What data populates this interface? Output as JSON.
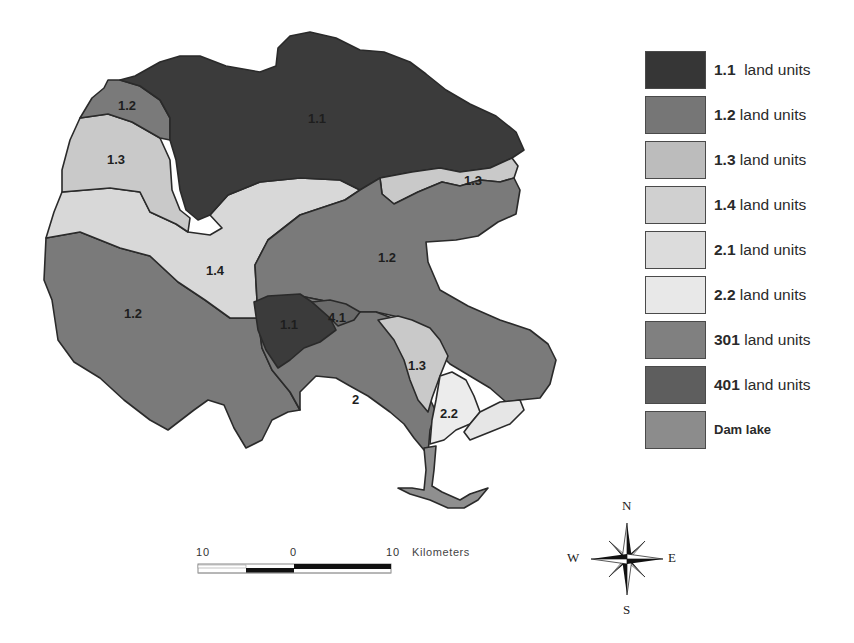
{
  "map": {
    "regions": [
      {
        "id": "1.1-north",
        "unit": "1.1",
        "label": "1.1",
        "color": "#3b3b3b"
      },
      {
        "id": "1.2-northwest",
        "unit": "1.2",
        "label": "1.2",
        "color": "#7a7a7a"
      },
      {
        "id": "1.3-northwest",
        "unit": "1.3",
        "label": "1.3",
        "color": "#c9c9c9"
      },
      {
        "id": "1.3-northeast",
        "unit": "1.3",
        "label": "1.3",
        "color": "#c9c9c9"
      },
      {
        "id": "1.4-central",
        "unit": "1.4",
        "label": "1.4",
        "color": "#d8d8d8"
      },
      {
        "id": "1.2-east",
        "unit": "1.2",
        "label": "1.2",
        "color": "#7a7a7a"
      },
      {
        "id": "1.2-southwest",
        "unit": "1.2",
        "label": "1.2",
        "color": "#7a7a7a"
      },
      {
        "id": "1.1-south",
        "unit": "1.1",
        "label": "1.1",
        "color": "#3b3b3b"
      },
      {
        "id": "4.1-south",
        "unit": "401",
        "label": "4.1",
        "color": "#6a6a6a"
      },
      {
        "id": "1.2-south",
        "unit": "1.2",
        "label": "2",
        "color": "#7a7a7a"
      },
      {
        "id": "1.3-south",
        "unit": "1.3",
        "label": "1.3",
        "color": "#c9c9c9"
      },
      {
        "id": "2.2-south",
        "unit": "2.2",
        "label": "2.2",
        "color": "#ececec"
      },
      {
        "id": "dam-lake",
        "unit": "Dam lake",
        "label": "",
        "color": "#8f8f8f"
      }
    ]
  },
  "legend": {
    "items": [
      {
        "code": "1.1",
        "text": "  land units",
        "color": "#363636"
      },
      {
        "code": "1.2",
        "text": " land units",
        "color": "#767676"
      },
      {
        "code": "1.3",
        "text": " land units",
        "color": "#bcbcbc"
      },
      {
        "code": "1.4",
        "text": " land units",
        "color": "#d0d0d0"
      },
      {
        "code": "2.1",
        "text": " land units",
        "color": "#dcdcdc"
      },
      {
        "code": "2.2",
        "text": " land units",
        "color": "#e8e8e8"
      },
      {
        "code": "301",
        "text": " land units",
        "color": "#808080"
      },
      {
        "code": "401",
        "text": " land units",
        "color": "#5e5e5e"
      },
      {
        "code": "Dam lake",
        "text": "",
        "color": "#8c8c8c"
      }
    ]
  },
  "scalebar": {
    "ticks": [
      "10",
      "0",
      "10"
    ],
    "unit": "Kilometers"
  },
  "compass": {
    "n": "N",
    "s": "S",
    "e": "E",
    "w": "W"
  }
}
